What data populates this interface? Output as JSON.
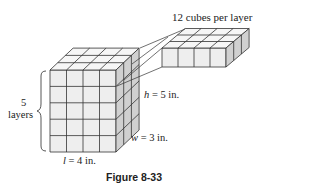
{
  "figure": {
    "caption": "Figure 8-33",
    "layer_label": "12 cubes per layer",
    "layers_count": "5",
    "layers_word": "layers",
    "height": {
      "var": "h",
      "rest": " = 5 in."
    },
    "width": {
      "var": "w",
      "rest": " = 3 in."
    },
    "length": {
      "var": "l",
      "rest": " = 4 in."
    }
  },
  "geometry": {
    "length_cubes": 4,
    "width_cubes": 3,
    "height_cubes": 5,
    "colors": {
      "front": "#eeeeee",
      "side": "#d0d0d0",
      "top": "#f6f6f6",
      "line": "#333333"
    }
  }
}
